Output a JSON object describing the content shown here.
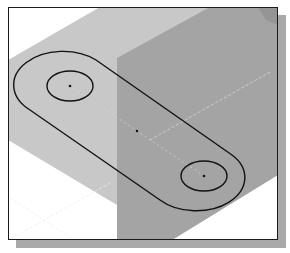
{
  "figure": {
    "caption_fragment": "",
    "view": "isometric-sketch-view",
    "colors": {
      "background": "#ffffff",
      "frame_border": "#1a1a1a",
      "shadow": "#a9a9a9",
      "light_face": "#c8c8c8",
      "dark_face": "#a4a4a4",
      "sketch_line": "#111111",
      "construction_line": "#eeeeee"
    },
    "slot": {
      "left_center": [
        70,
        86
      ],
      "right_center": [
        204,
        176
      ],
      "inner_circle_rx": 23,
      "inner_circle_ry": 15,
      "outer_rx": 44,
      "outer_ry": 30,
      "center_point": [
        137,
        131
      ]
    }
  }
}
